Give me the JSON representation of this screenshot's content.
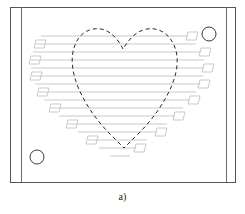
{
  "figure": {
    "caption": "a)",
    "canvas": {
      "width": 245,
      "height": 214
    }
  },
  "colors": {
    "background": "#ffffff",
    "frame_stroke": "#555555",
    "inner_rule_stroke": "#6b6b6b",
    "part_outline_stroke": "#2b2b2b",
    "toolpath_stroke": "#c9c9c9",
    "hole_stroke": "#3a3a3a",
    "caption_text": "#1a1a1a"
  },
  "workpiece": {
    "name": "workpiece-plate",
    "outer_rect": {
      "x": 10,
      "y": 7,
      "width": 226,
      "height": 176
    },
    "inner_rules": [
      {
        "name": "left-inner-rule",
        "x": 21,
        "y1": 7,
        "y2": 183
      },
      {
        "name": "right-inner-rule",
        "x": 227,
        "y1": 7,
        "y2": 183
      }
    ],
    "stroke_width": 1
  },
  "holes": [
    {
      "name": "hole-top-right",
      "cx": 209,
      "cy": 34,
      "r": 7
    },
    {
      "name": "hole-bottom-left",
      "cx": 37,
      "cy": 157,
      "r": 7
    }
  ],
  "part_outline": {
    "name": "heart-outline",
    "style": "dashed",
    "dash_pattern": "4 3",
    "stroke_width": 1,
    "path": "M 123 49 C 119 41 112 31 101 29 C 89 27 79 34 75 45 C 70 57 72 72 78 87 C 85 104 97 121 110 134 C 117 141 121 145 124 148 C 127 145 132 140 139 133 C 153 119 165 102 172 85 C 178 70 179 56 174 45 C 169 34 159 27 147 29 C 135 31 128 41 123 49 Z"
  },
  "toolpath": {
    "name": "raster-infill-toolpath",
    "stroke_width": 1,
    "description": "Zigzag raster scan path with alternating end turnarounds",
    "passes": [
      {
        "index": 1,
        "y": 36,
        "x_start": 41,
        "x_end": 188,
        "turn_side": "right"
      },
      {
        "index": 2,
        "y": 44,
        "x_start": 36,
        "x_end": 196,
        "turn_side": "left"
      },
      {
        "index": 3,
        "y": 52,
        "x_start": 33,
        "x_end": 201,
        "turn_side": "right"
      },
      {
        "index": 4,
        "y": 60,
        "x_start": 31,
        "x_end": 204,
        "turn_side": "left"
      },
      {
        "index": 5,
        "y": 68,
        "x_start": 31,
        "x_end": 204,
        "turn_side": "right"
      },
      {
        "index": 6,
        "y": 76,
        "x_start": 32,
        "x_end": 203,
        "turn_side": "left"
      },
      {
        "index": 7,
        "y": 84,
        "x_start": 35,
        "x_end": 200,
        "turn_side": "right"
      },
      {
        "index": 8,
        "y": 92,
        "x_start": 39,
        "x_end": 196,
        "turn_side": "left"
      },
      {
        "index": 9,
        "y": 100,
        "x_start": 44,
        "x_end": 190,
        "turn_side": "right"
      },
      {
        "index": 10,
        "y": 108,
        "x_start": 51,
        "x_end": 183,
        "turn_side": "left"
      },
      {
        "index": 11,
        "y": 116,
        "x_start": 59,
        "x_end": 175,
        "turn_side": "right"
      },
      {
        "index": 12,
        "y": 124,
        "x_start": 68,
        "x_end": 167,
        "turn_side": "left"
      },
      {
        "index": 13,
        "y": 132,
        "x_start": 78,
        "x_end": 157,
        "turn_side": "right"
      },
      {
        "index": 14,
        "y": 140,
        "x_start": 88,
        "x_end": 147,
        "turn_side": "left"
      },
      {
        "index": 15,
        "y": 148,
        "x_start": 99,
        "x_end": 136,
        "turn_side": "right"
      },
      {
        "index": 16,
        "y": 156,
        "x_start": 110,
        "x_end": 130,
        "turn_side": "left"
      }
    ],
    "turnarounds": [
      {
        "name": "turn-right-1",
        "path": "M 188 32 L 198 32 L 196 40 L 186 40 Z"
      },
      {
        "name": "turn-left-1",
        "path": "M 36 40 L 46 40 L 44 48 L 34 48 Z"
      },
      {
        "name": "turn-right-2",
        "path": "M 201 48 L 211 48 L 209 56 L 199 56 Z"
      },
      {
        "name": "turn-left-2",
        "path": "M 31 56 L 41 56 L 39 64 L 29 64 Z"
      },
      {
        "name": "turn-right-3",
        "path": "M 204 64 L 214 64 L 212 72 L 202 72 Z"
      },
      {
        "name": "turn-left-3",
        "path": "M 32 72 L 42 72 L 40 80 L 30 80 Z"
      },
      {
        "name": "turn-right-4",
        "path": "M 200 80 L 210 80 L 208 88 L 198 88 Z"
      },
      {
        "name": "turn-left-4",
        "path": "M 39 88 L 49 88 L 47 96 L 37 96 Z"
      },
      {
        "name": "turn-right-5",
        "path": "M 190 96 L 200 96 L 198 104 L 188 104 Z"
      },
      {
        "name": "turn-left-5",
        "path": "M 51 104 L 61 104 L 59 112 L 49 112 Z"
      },
      {
        "name": "turn-right-6",
        "path": "M 175 112 L 185 112 L 183 120 L 173 120 Z"
      },
      {
        "name": "turn-left-6",
        "path": "M 68 120 L 78 120 L 76 128 L 66 128 Z"
      },
      {
        "name": "turn-right-7",
        "path": "M 157 128 L 167 128 L 165 136 L 155 136 Z"
      },
      {
        "name": "turn-left-7",
        "path": "M 88 136 L 98 136 L 96 144 L 86 144 Z"
      },
      {
        "name": "turn-right-8",
        "path": "M 136 144 L 146 144 L 144 152 L 134 152 Z"
      }
    ]
  }
}
